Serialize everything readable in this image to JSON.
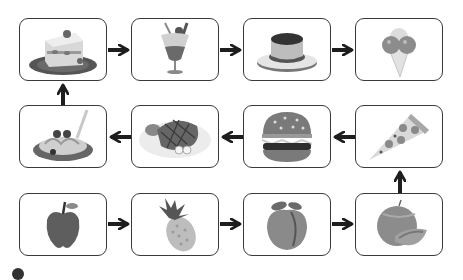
{
  "diagram": {
    "flow_order": [
      "apple",
      "pineapple",
      "peach",
      "melon",
      "pizza",
      "hamburger",
      "steak",
      "spaghetti",
      "strawberry-shortcake",
      "parfait",
      "pudding",
      "ice-cream"
    ],
    "nodes": [
      {
        "id": "cake",
        "label": "Strawberry shortcake",
        "row": 1,
        "col": 1
      },
      {
        "id": "parfait",
        "label": "Parfait",
        "row": 1,
        "col": 2
      },
      {
        "id": "pudding",
        "label": "Pudding",
        "row": 1,
        "col": 3
      },
      {
        "id": "icecream",
        "label": "Ice cream cone",
        "row": 1,
        "col": 4
      },
      {
        "id": "spaghetti",
        "label": "Spaghetti with meatballs",
        "row": 2,
        "col": 1
      },
      {
        "id": "steak",
        "label": "Steak",
        "row": 2,
        "col": 2
      },
      {
        "id": "burger",
        "label": "Hamburger",
        "row": 2,
        "col": 3
      },
      {
        "id": "pizza",
        "label": "Pizza slice",
        "row": 2,
        "col": 4
      },
      {
        "id": "apple",
        "label": "Apple",
        "row": 3,
        "col": 1
      },
      {
        "id": "pineapple",
        "label": "Pineapple",
        "row": 3,
        "col": 2
      },
      {
        "id": "peach",
        "label": "Peach",
        "row": 3,
        "col": 3
      },
      {
        "id": "melon",
        "label": "Melon",
        "row": 3,
        "col": 4
      }
    ],
    "edges": [
      {
        "from": "apple",
        "to": "pineapple",
        "dir": "right"
      },
      {
        "from": "pineapple",
        "to": "peach",
        "dir": "right"
      },
      {
        "from": "peach",
        "to": "melon",
        "dir": "right"
      },
      {
        "from": "melon",
        "to": "pizza",
        "dir": "up"
      },
      {
        "from": "pizza",
        "to": "burger",
        "dir": "left"
      },
      {
        "from": "burger",
        "to": "steak",
        "dir": "left"
      },
      {
        "from": "steak",
        "to": "spaghetti",
        "dir": "left"
      },
      {
        "from": "spaghetti",
        "to": "cake",
        "dir": "up"
      },
      {
        "from": "cake",
        "to": "parfait",
        "dir": "right"
      },
      {
        "from": "parfait",
        "to": "pudding",
        "dir": "right"
      },
      {
        "from": "pudding",
        "to": "icecream",
        "dir": "right"
      }
    ],
    "colors": {
      "border": "#3a3a3a",
      "arrow": "#1e1e1e",
      "background": "#ffffff"
    }
  }
}
